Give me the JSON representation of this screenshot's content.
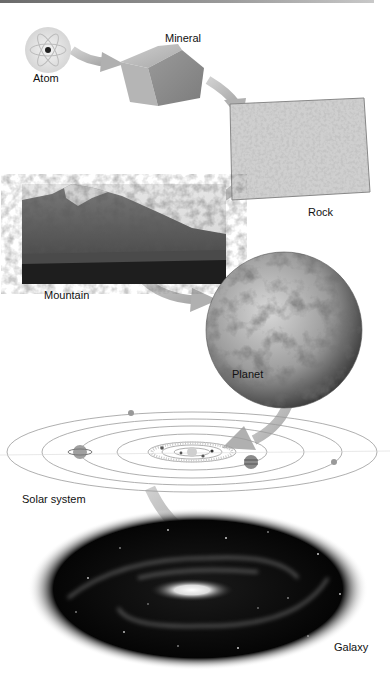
{
  "diagram": {
    "nodes": [
      {
        "id": "atom",
        "label": "Atom"
      },
      {
        "id": "mineral",
        "label": "Mineral"
      },
      {
        "id": "rock",
        "label": "Rock"
      },
      {
        "id": "mountain",
        "label": "Mountain"
      },
      {
        "id": "planet",
        "label": "Planet"
      },
      {
        "id": "solar-system",
        "label": "Solar system"
      },
      {
        "id": "galaxy",
        "label": "Galaxy"
      }
    ],
    "edges": [
      {
        "from": "atom",
        "to": "mineral"
      },
      {
        "from": "mineral",
        "to": "rock"
      },
      {
        "from": "rock",
        "to": "mountain"
      },
      {
        "from": "mountain",
        "to": "planet"
      },
      {
        "from": "planet",
        "to": "solar-system"
      },
      {
        "from": "solar-system",
        "to": "galaxy"
      }
    ],
    "colors": {
      "arrow": "#b8b8b8",
      "text": "#111111",
      "background": "#ffffff"
    }
  }
}
